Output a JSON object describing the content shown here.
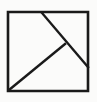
{
  "figure": {
    "caption": "",
    "background_color": "#fbfbfa",
    "stroke_color": "#1a1a1a",
    "canvas": {
      "width": 97,
      "height": 102
    },
    "square": {
      "name": "outer-square",
      "x": 8,
      "y": 12,
      "width": 80,
      "height": 79,
      "stroke_width": 2.6,
      "points": "8,12 88,12 88,91 8,91 8,12"
    },
    "lines": [
      {
        "name": "diagonal-top-to-right",
        "x1": 42,
        "y1": 13,
        "x2": 88,
        "y2": 67,
        "stroke_width": 2.4
      },
      {
        "name": "diagonal-junction-to-bottom-left",
        "x1": 65,
        "y1": 44,
        "x2": 9,
        "y2": 90,
        "stroke_width": 2.4
      }
    ],
    "vertices": [
      {
        "name": "top-left-corner",
        "x": 8,
        "y": 12
      },
      {
        "name": "top-right-corner",
        "x": 88,
        "y": 12
      },
      {
        "name": "bottom-right-corner",
        "x": 88,
        "y": 91
      },
      {
        "name": "bottom-left-corner",
        "x": 8,
        "y": 91
      },
      {
        "name": "top-edge-cut-point",
        "x": 42,
        "y": 13
      },
      {
        "name": "right-edge-cut-point",
        "x": 88,
        "y": 67
      },
      {
        "name": "interior-junction-point",
        "x": 65,
        "y": 44
      }
    ]
  }
}
